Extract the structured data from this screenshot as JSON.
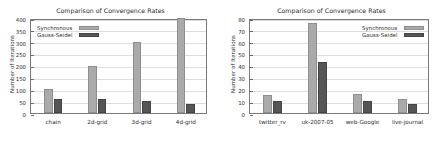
{
  "figure": {
    "panels": [
      "left",
      "right"
    ]
  },
  "legend_entries": [
    {
      "label": "Synchronous",
      "color": "#aaaaaa",
      "swatch": "legend-swatch-synchronous"
    },
    {
      "label": "Gauss-Seidel",
      "color": "#555555",
      "swatch": "legend-swatch-gauss-seidel"
    }
  ],
  "chart_data": [
    {
      "type": "bar",
      "title": "Comparison of Convergence Rates",
      "xlabel": "",
      "ylabel": "Number of Iterations",
      "categories": [
        "chain",
        "2d-grid",
        "3d-grid",
        "4d-grid"
      ],
      "series": [
        {
          "name": "Synchronous",
          "color": "#aaaaaa",
          "values": [
            100,
            200,
            297,
            400
          ]
        },
        {
          "name": "Gauss-Seidel",
          "color": "#555555",
          "values": [
            60,
            57,
            50,
            38
          ]
        }
      ],
      "ylim": [
        0,
        400
      ],
      "yticks": [
        0,
        50,
        100,
        150,
        200,
        250,
        300,
        350,
        400
      ],
      "grid": true,
      "legend_position": "upper left"
    },
    {
      "type": "bar",
      "title": "Comparison of Convergence Rates",
      "xlabel": "",
      "ylabel": "Number of Iterations",
      "categories": [
        "twitter_rv",
        "uk-2007-05",
        "web-Google",
        "live-journal"
      ],
      "series": [
        {
          "name": "Synchronous",
          "color": "#aaaaaa",
          "values": [
            15,
            76,
            16,
            12
          ]
        },
        {
          "name": "Gauss-Seidel",
          "color": "#555555",
          "values": [
            10,
            43,
            10,
            8
          ]
        }
      ],
      "ylim": [
        0,
        80
      ],
      "yticks": [
        0,
        10,
        20,
        30,
        40,
        50,
        60,
        70,
        80
      ],
      "grid": true,
      "legend_position": "upper right"
    }
  ]
}
